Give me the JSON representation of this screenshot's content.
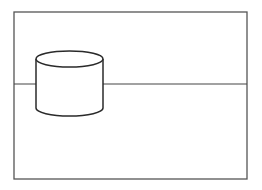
{
  "canvas": {
    "width": 262,
    "height": 190,
    "background": "#ffffff"
  },
  "colors": {
    "stroke": "#2a2a2a",
    "frame": "#555555",
    "fill": "#ffffff"
  },
  "frame": {
    "x": 14,
    "y": 12,
    "width": 233,
    "height": 167
  },
  "horizon": {
    "y": 84,
    "x1": 14,
    "x2": 247
  },
  "cylinder": {
    "cx": 69.5,
    "rx": 33.5,
    "top_cy": 59,
    "ry": 8,
    "bottom_cy": 108
  }
}
